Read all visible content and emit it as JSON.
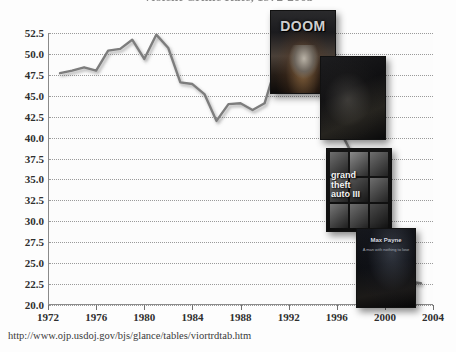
{
  "title": "Violent Crime Rate, 1972-2003",
  "source_url": "http://www.ojp.usdoj.gov/bjs/glance/tables/viortrdtab.htm",
  "axis": {
    "y_ticks": [
      "52.5",
      "50.0",
      "47.5",
      "45.0",
      "42.5",
      "40.0",
      "37.5",
      "35.0",
      "32.5",
      "30.0",
      "27.5",
      "25.0",
      "22.5",
      "20.0"
    ],
    "x_ticks": [
      "1972",
      "1976",
      "1980",
      "1984",
      "1988",
      "1992",
      "1996",
      "2000",
      "2004"
    ]
  },
  "boxarts": [
    {
      "name": "doom",
      "caption": "DOOM",
      "sub": ""
    },
    {
      "name": "dark-shooter",
      "caption": "",
      "sub": ""
    },
    {
      "name": "grand-theft-auto-iii",
      "caption": "",
      "sub": "",
      "line1": "grand",
      "line2": "theft",
      "line3": "auto III"
    },
    {
      "name": "max-payne",
      "caption": "Max Payne",
      "sub": "A man with nothing to lose"
    }
  ],
  "colors": {
    "line": "#7d7d7d",
    "grid": "#9a9a9a",
    "axis": "#8a8a8a",
    "text": "#2f2f2f",
    "background": "#fdfdfd"
  },
  "chart_data": {
    "type": "line",
    "title": "Violent Crime Rate, 1972-2003",
    "xlabel": "",
    "ylabel": "",
    "xlim": [
      1972,
      2004
    ],
    "ylim": [
      20.0,
      52.5
    ],
    "grid": true,
    "legend": "none",
    "x": [
      1973,
      1974,
      1975,
      1976,
      1977,
      1978,
      1979,
      1980,
      1981,
      1982,
      1983,
      1984,
      1985,
      1986,
      1987,
      1988,
      1989,
      1990,
      1991,
      1992,
      1993,
      1994,
      1995,
      1996,
      1997,
      1998,
      1999,
      2000,
      2001,
      2002,
      2003
    ],
    "series": [
      {
        "name": "Violent victimization rate per 1,000 persons age 12 or older",
        "values": [
          47.7,
          48.0,
          48.4,
          48.0,
          50.4,
          50.6,
          51.7,
          49.4,
          52.3,
          50.7,
          46.6,
          46.4,
          45.2,
          42.0,
          44.0,
          44.1,
          43.3,
          44.1,
          48.8,
          47.9,
          49.9,
          51.2,
          46.1,
          41.6,
          38.8,
          36.0,
          32.1,
          27.4,
          25.1,
          22.8,
          22.6
        ]
      }
    ],
    "annotations": [
      {
        "label": "DOOM",
        "near_x": 1993
      },
      {
        "label": "dark-shooter",
        "near_x": 1996
      },
      {
        "label": "Grand Theft Auto III",
        "near_x": 2001
      },
      {
        "label": "Max Payne",
        "near_x": 2002
      }
    ]
  }
}
